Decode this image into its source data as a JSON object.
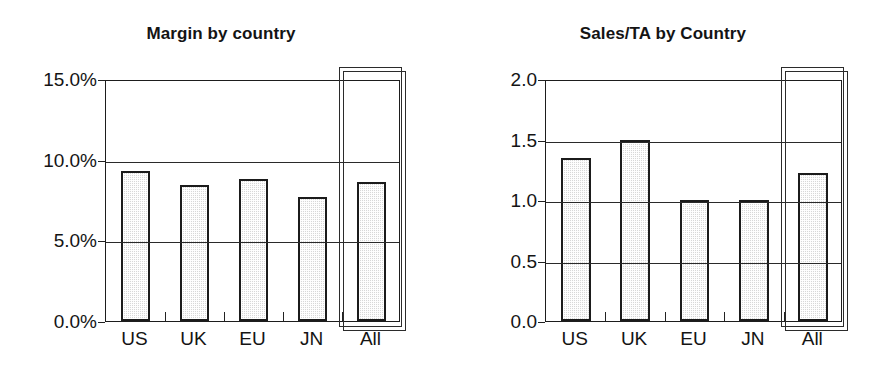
{
  "figure": {
    "width": 884,
    "height": 368,
    "background": "#ffffff",
    "ink_color": "#1a1a1a",
    "bar_fill": "#d8d8d8",
    "bar_edge": "#1b1b1b"
  },
  "chart_data": [
    {
      "type": "bar",
      "title": "Margin by country",
      "xlabel": "",
      "ylabel": "",
      "categories": [
        "US",
        "UK",
        "EU",
        "JN",
        "All"
      ],
      "values": [
        9.3,
        8.4,
        8.8,
        7.7,
        8.6
      ],
      "value_format": "percent",
      "ylim": [
        0.0,
        15.0
      ],
      "yticks": [
        0.0,
        5.0,
        10.0,
        15.0
      ],
      "ytick_labels": [
        "0.0%",
        "5.0%",
        "10.0%",
        "15.0%"
      ],
      "grid": true,
      "legend": "none",
      "highlight_category": "All",
      "annotations": []
    },
    {
      "type": "bar",
      "title": "Sales/TA by Country",
      "xlabel": "",
      "ylabel": "",
      "categories": [
        "US",
        "UK",
        "EU",
        "JN",
        "All"
      ],
      "values": [
        1.35,
        1.5,
        1.0,
        1.0,
        1.22
      ],
      "value_format": "decimal",
      "ylim": [
        0.0,
        2.0
      ],
      "yticks": [
        0.0,
        0.5,
        1.0,
        1.5,
        2.0
      ],
      "ytick_labels": [
        "0.0",
        "0.5",
        "1.0",
        "1.5",
        "2.0"
      ],
      "grid": true,
      "legend": "none",
      "highlight_category": "All",
      "annotations": []
    }
  ]
}
